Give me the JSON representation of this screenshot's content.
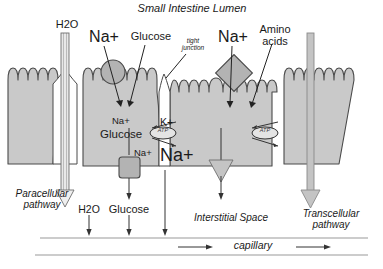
{
  "figure": {
    "title": "Small Intestine Lumen",
    "type": "biology-diagram"
  },
  "colors": {
    "cell_fill": "#c9c9c9",
    "cell_stroke": "#4a4a4a",
    "transporter_fill": "#b3b3b3",
    "arrow_fill": "#c4c4c4",
    "text": "#1a1a1a",
    "capillary_line": "#9a9a9a"
  },
  "labels": {
    "lumen_title": "Small Intestine Lumen",
    "h2o_top": "H2O",
    "na_left": "Na+",
    "glucose_top": "Glucose",
    "tight_junction": "tight\njunction",
    "na_mid": "Na+",
    "amino_acids": "Amino\nacids",
    "na_in_cell": "Na+",
    "glucose_in_cell": "Glucose",
    "k_plus": "K+",
    "na_lower_small": "Na+",
    "na_big": "Na+",
    "atp_left": "ATP",
    "atp_right": "ATP",
    "paracellular": "Paracellular\npathway",
    "transcellular": "Transcellular\npathway",
    "h2o_bottom": "H2O",
    "glucose_bottom": "Glucose",
    "interstitial": "Interstitial Space",
    "capillary": "capillary"
  },
  "structures": {
    "cells": [
      "cell-1-left",
      "cell-2-glucose",
      "cell-3-aminoacid",
      "cell-4-right"
    ],
    "transporters": [
      {
        "name": "na-glucose-cotransporter",
        "shape": "circle"
      },
      {
        "name": "glucose-uniporter",
        "shape": "rounded-square"
      },
      {
        "name": "na-amino-acid-cotransporter",
        "shape": "diamond"
      },
      {
        "name": "na-k-atpase-left",
        "shape": "oval",
        "label": "ATP"
      },
      {
        "name": "na-k-atpase-right",
        "shape": "oval",
        "label": "ATP"
      }
    ],
    "pathways": [
      "paracellular",
      "transcellular"
    ]
  }
}
